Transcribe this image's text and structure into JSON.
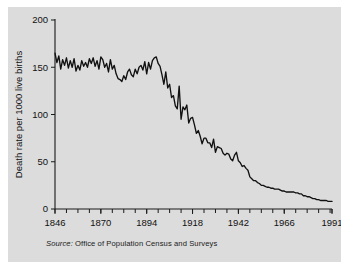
{
  "figure": {
    "background_color": "#dcdcdc",
    "page_background": "#ffffff",
    "line_color": "#111111",
    "axis_color": "#1a1a1a"
  },
  "source": {
    "lead": "Source:",
    "text": "Office of Population Census and Surveys",
    "full": "Source: Office of Population Census and Surveys"
  },
  "chart_data": {
    "type": "line",
    "title": "",
    "xlabel": "",
    "ylabel": "Death rate per 1000 live births",
    "xlim": [
      1846,
      1991
    ],
    "ylim": [
      0,
      200
    ],
    "grid": false,
    "legend": false,
    "x_ticks": [
      1846,
      1870,
      1894,
      1918,
      1942,
      1966,
      1991
    ],
    "x_tick_labels": [
      "1846",
      "1870",
      "1894",
      "1918",
      "1942",
      "1966",
      "1991"
    ],
    "x_minor_tick_interval": 6,
    "y_ticks": [
      0,
      50,
      100,
      150,
      200
    ],
    "y_tick_labels": [
      "0",
      "50",
      "100",
      "150",
      "200"
    ],
    "series": [
      {
        "name": "Infant death rate",
        "x": [
          1846,
          1847,
          1848,
          1849,
          1850,
          1851,
          1852,
          1853,
          1854,
          1855,
          1856,
          1857,
          1858,
          1859,
          1860,
          1861,
          1862,
          1863,
          1864,
          1865,
          1866,
          1867,
          1868,
          1869,
          1870,
          1871,
          1872,
          1873,
          1874,
          1875,
          1876,
          1877,
          1878,
          1879,
          1880,
          1881,
          1882,
          1883,
          1884,
          1885,
          1886,
          1887,
          1888,
          1889,
          1890,
          1891,
          1892,
          1893,
          1894,
          1895,
          1896,
          1897,
          1898,
          1899,
          1900,
          1901,
          1902,
          1903,
          1904,
          1905,
          1906,
          1907,
          1908,
          1909,
          1910,
          1911,
          1912,
          1913,
          1914,
          1915,
          1916,
          1917,
          1918,
          1919,
          1920,
          1921,
          1922,
          1923,
          1924,
          1925,
          1926,
          1927,
          1928,
          1929,
          1930,
          1931,
          1932,
          1933,
          1934,
          1935,
          1936,
          1937,
          1938,
          1939,
          1940,
          1941,
          1942,
          1943,
          1944,
          1945,
          1946,
          1947,
          1948,
          1949,
          1950,
          1951,
          1952,
          1953,
          1954,
          1955,
          1956,
          1957,
          1958,
          1959,
          1960,
          1961,
          1962,
          1963,
          1964,
          1965,
          1966,
          1967,
          1968,
          1969,
          1970,
          1971,
          1972,
          1973,
          1974,
          1975,
          1976,
          1977,
          1978,
          1979,
          1980,
          1981,
          1982,
          1983,
          1984,
          1985,
          1986,
          1987,
          1988,
          1989,
          1990,
          1991
        ],
        "y": [
          165,
          155,
          162,
          148,
          158,
          152,
          160,
          149,
          157,
          150,
          159,
          146,
          152,
          147,
          157,
          151,
          155,
          150,
          159,
          154,
          160,
          151,
          157,
          148,
          161,
          158,
          150,
          154,
          145,
          158,
          148,
          152,
          143,
          138,
          137,
          135,
          141,
          137,
          145,
          148,
          142,
          140,
          148,
          143,
          150,
          152,
          147,
          156,
          143,
          155,
          148,
          157,
          160,
          161,
          154,
          151,
          142,
          132,
          145,
          128,
          132,
          118,
          120,
          109,
          106,
          130,
          95,
          108,
          105,
          110,
          91,
          96,
          97,
          89,
          80,
          83,
          77,
          69,
          75,
          75,
          70,
          70,
          65,
          74,
          60,
          66,
          65,
          64,
          59,
          57,
          59,
          58,
          53,
          51,
          57,
          60,
          51,
          49,
          45,
          46,
          43,
          41,
          34,
          32,
          30,
          30,
          28,
          27,
          25,
          25,
          24,
          23,
          23,
          22,
          22,
          21,
          21,
          21,
          20,
          19,
          19,
          18,
          18,
          18,
          18,
          18,
          17,
          17,
          16,
          16,
          14,
          14,
          13,
          13,
          12,
          11,
          11,
          10,
          10,
          9,
          9,
          9,
          9,
          8,
          8,
          8
        ]
      }
    ],
    "annotations": [
      {
        "label": "high plateau mid-19th century",
        "approx_value": 150
      },
      {
        "label": "peak around 1899",
        "approx_value": 161
      },
      {
        "label": "steep decline after 1900",
        "approx_value": 0
      },
      {
        "label": "wartime bump around 1940-1941",
        "approx_value": 60
      },
      {
        "label": "final value 1991",
        "approx_value": 8
      }
    ]
  }
}
